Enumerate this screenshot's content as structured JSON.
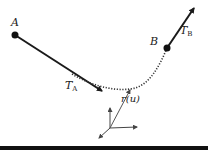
{
  "diagram": {
    "labels": {
      "point_a": "A",
      "point_b": "B",
      "tangent_a_main": "T",
      "tangent_a_sub": "A",
      "tangent_b_main": "T",
      "tangent_b_sub": "B",
      "position_vector": "r(u)"
    },
    "colors": {
      "stroke": "#1a1a1a",
      "curve": "#333333",
      "vector": "#555555",
      "background": "#ffffff"
    }
  }
}
